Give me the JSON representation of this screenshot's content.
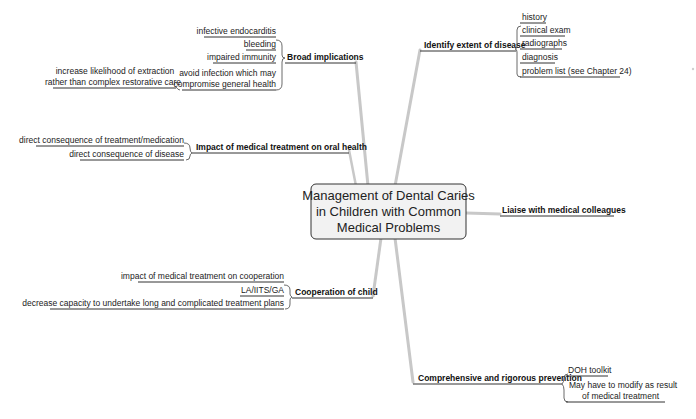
{
  "mindmap": {
    "central": {
      "lines": [
        "Management of Dental Caries",
        "in Children with Common",
        "Medical Problems"
      ]
    },
    "branches": {
      "broad": {
        "label": "Broad implications",
        "children": [
          "infective endocarditis",
          "bleeding",
          "impaired immunity",
          "avoid infection which may",
          "compromise general health"
        ],
        "grandchild": [
          "increase likelihood of extraction",
          "rather than complex restorative care"
        ]
      },
      "impact": {
        "label": "Impact of medical treatment on oral health",
        "children": [
          "direct consequence of treatment/medication",
          "direct consequence of disease"
        ]
      },
      "cooperation": {
        "label": "Cooperation of child",
        "children": [
          "impact of medical treatment on cooperation",
          "LA/IITS/GA",
          "decrease capacity to undertake long and complicated treatment plans"
        ]
      },
      "identify": {
        "label": "Identify extent of disease",
        "children": [
          "history",
          "clinical exam",
          "radiographs",
          "diagnosis",
          "problem list (see Chapter 24)"
        ]
      },
      "liaise": {
        "label": "Liaise with medical colleagues"
      },
      "prevention": {
        "label": "Comprehensive and rigorous prevention",
        "children": [
          "DOH toolkit",
          "May have to modify as result",
          "of medical treatment"
        ]
      }
    },
    "colors": {
      "background": "#ffffff",
      "text": "#222222",
      "connector": "#c8c8c8",
      "center_fill": "#f2f2f2",
      "center_border": "#333333"
    }
  }
}
